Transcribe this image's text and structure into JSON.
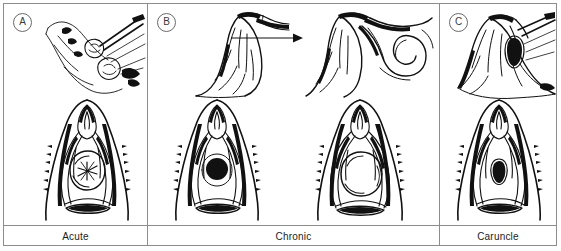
{
  "figure": {
    "type": "medical-illustration-plate",
    "panel_count": 3,
    "style": "pen-and-ink line drawing"
  },
  "panels": [
    {
      "tag": "A",
      "tag_name": "panel-letter-a",
      "caption": "Acute",
      "views": [
        {
          "name": "sagittal-inset-acute",
          "description": "sagittal sectional inset of vulva with instrument at duct orifice"
        },
        {
          "name": "vulva-frontal-acute",
          "description": "frontal view of vulva with swollen acute abscess at gland, stellate ostium"
        }
      ]
    },
    {
      "tag": "B",
      "tag_name": "panel-letter-b",
      "caption": "Chronic",
      "has_progression_arrow": true,
      "arrow_name": "progression-arrow",
      "views": [
        {
          "name": "sagittal-inset-chronic-early",
          "description": "sagittal sectional inset showing duct obstruction"
        },
        {
          "name": "sagittal-inset-chronic-late",
          "description": "sagittal sectional inset showing dilated coiled cystic duct"
        },
        {
          "name": "vulva-frontal-chronic-early",
          "description": "frontal view of vulva with dark punctate duct opening"
        },
        {
          "name": "vulva-frontal-chronic-late",
          "description": "frontal view of vulva with large pale retention cyst"
        }
      ]
    },
    {
      "tag": "C",
      "tag_name": "panel-letter-c",
      "caption": "Caruncle",
      "views": [
        {
          "name": "sagittal-inset-caruncle",
          "description": "sagittal sectional inset of urethra with caruncle at meatus"
        },
        {
          "name": "vulva-frontal-caruncle",
          "description": "frontal view of vulva with small fleshy urethral caruncle at meatus"
        }
      ]
    }
  ],
  "colors": {
    "frame": "#8c8c8c",
    "ink": "#111111",
    "paper": "#ffffff",
    "tag_text": "#3b3b3b",
    "label_text": "#1c1c1c"
  }
}
